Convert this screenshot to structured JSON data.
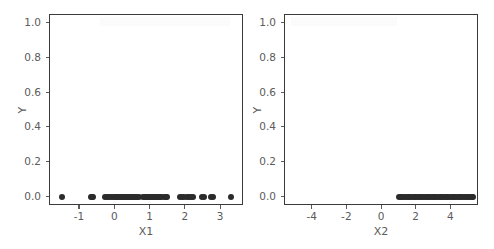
{
  "figure": {
    "background_color": "#ffffff",
    "marker_color": "#2b2b2b",
    "spine_color": "#3a3a3a",
    "tick_color": "#5b5b5b",
    "width": 494,
    "height": 249
  },
  "chart_data": [
    {
      "type": "scatter",
      "panel": "left",
      "title": "",
      "xlabel": "X1",
      "ylabel": "Y",
      "xlim": [
        -1.85,
        3.65
      ],
      "ylim": [
        -0.05,
        1.05
      ],
      "grid": false,
      "legend": "none",
      "xticks": [
        -1,
        0,
        1,
        2,
        3
      ],
      "xticklabels": [
        "-1",
        "0",
        "1",
        "2",
        "3"
      ],
      "yticks": [
        0.0,
        0.2,
        0.4,
        0.6,
        0.8,
        1.0
      ],
      "yticklabels": [
        "0.0",
        "0.2",
        "0.4",
        "0.6",
        "0.8",
        "1.0"
      ],
      "marker": "circle",
      "marker_size": 6,
      "x": [
        -1.51,
        -0.7,
        -0.66,
        -0.62,
        -0.3,
        -0.24,
        -0.18,
        -0.12,
        -0.06,
        -0.02,
        0.02,
        0.06,
        0.1,
        0.14,
        0.18,
        0.22,
        0.26,
        0.3,
        0.34,
        0.38,
        0.42,
        0.46,
        0.5,
        0.54,
        0.58,
        0.62,
        0.66,
        0.78,
        0.84,
        0.88,
        0.92,
        0.96,
        1.0,
        1.04,
        1.08,
        1.12,
        1.16,
        1.2,
        1.24,
        1.28,
        1.32,
        1.4,
        1.44,
        1.48,
        1.84,
        1.9,
        1.96,
        2.02,
        2.08,
        2.14,
        2.2,
        2.46,
        2.52,
        2.72,
        2.78,
        3.28
      ],
      "y": [
        0.0,
        0.0,
        0.0,
        0.0,
        0.0,
        0.0,
        0.0,
        0.0,
        0.0,
        0.0,
        0.0,
        0.0,
        0.0,
        0.0,
        0.0,
        0.0,
        0.0,
        0.0,
        0.0,
        0.0,
        0.0,
        0.0,
        0.0,
        0.0,
        0.0,
        0.0,
        0.0,
        0.0,
        0.0,
        0.0,
        0.0,
        0.0,
        0.0,
        0.0,
        0.0,
        0.0,
        0.0,
        0.0,
        0.0,
        0.0,
        0.0,
        0.0,
        0.0,
        0.0,
        0.0,
        0.0,
        0.0,
        0.0,
        0.0,
        0.0,
        0.0,
        0.0,
        0.0,
        0.0,
        0.0,
        0.0
      ]
    },
    {
      "type": "scatter",
      "panel": "right",
      "title": "",
      "xlabel": "X2",
      "ylabel": "Y",
      "xlim": [
        -5.6,
        5.6
      ],
      "ylim": [
        -0.05,
        1.05
      ],
      "grid": false,
      "legend": "none",
      "xticks": [
        -4,
        -2,
        0,
        2,
        4
      ],
      "xticklabels": [
        "-4",
        "-2",
        "0",
        "2",
        "4"
      ],
      "yticks": [
        0.0,
        0.2,
        0.4,
        0.6,
        0.8,
        1.0
      ],
      "yticklabels": [
        "0.0",
        "0.2",
        "0.4",
        "0.6",
        "0.8",
        "1.0"
      ],
      "marker": "circle",
      "marker_size": 6,
      "x": [
        0.98,
        1.08,
        1.18,
        1.28,
        1.38,
        1.48,
        1.58,
        1.68,
        1.78,
        1.88,
        1.98,
        2.08,
        2.18,
        2.28,
        2.38,
        2.48,
        2.58,
        2.68,
        2.78,
        2.88,
        2.98,
        3.08,
        3.18,
        3.28,
        3.38,
        3.48,
        3.58,
        3.68,
        3.78,
        3.88,
        3.98,
        4.08,
        4.18,
        4.28,
        4.38,
        4.48,
        4.58,
        4.68,
        4.78,
        4.88,
        4.98,
        5.08,
        5.18,
        5.28
      ],
      "y": [
        0.0,
        0.0,
        0.0,
        0.0,
        0.0,
        0.0,
        0.0,
        0.0,
        0.0,
        0.0,
        0.0,
        0.0,
        0.0,
        0.0,
        0.0,
        0.0,
        0.0,
        0.0,
        0.0,
        0.0,
        0.0,
        0.0,
        0.0,
        0.0,
        0.0,
        0.0,
        0.0,
        0.0,
        0.0,
        0.0,
        0.0,
        0.0,
        0.0,
        0.0,
        0.0,
        0.0,
        0.0,
        0.0,
        0.0,
        0.0,
        0.0,
        0.0,
        0.0,
        0.0
      ]
    }
  ]
}
